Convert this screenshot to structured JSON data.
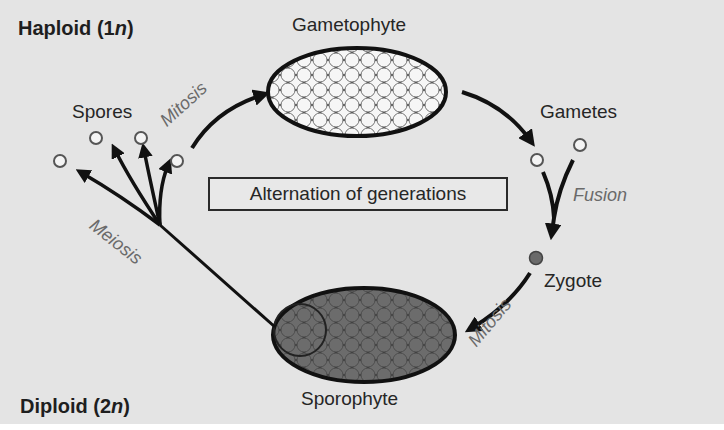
{
  "diagram": {
    "title": "Alternation of generations",
    "regions": {
      "haploid": {
        "label": "Haploid (1",
        "italic": "n",
        "close": ")"
      },
      "diploid": {
        "label": "Diploid (2",
        "italic": "n",
        "close": ")"
      }
    },
    "stages": {
      "gametophyte": "Gametophyte",
      "gametes": "Gametes",
      "zygote": "Zygote",
      "sporophyte": "Sporophyte",
      "spores": "Spores"
    },
    "processes": {
      "mitosis_top": "Mitosis",
      "fusion": "Fusion",
      "mitosis_bottom": "Mitosis",
      "meiosis": "Meiosis"
    },
    "colors": {
      "background": "#e4e4e4",
      "haploid_fill": "#f4f4f4",
      "diploid_fill": "#5a5a5a",
      "outline": "#1a1a1a",
      "process_text": "#6a6a6a"
    }
  }
}
